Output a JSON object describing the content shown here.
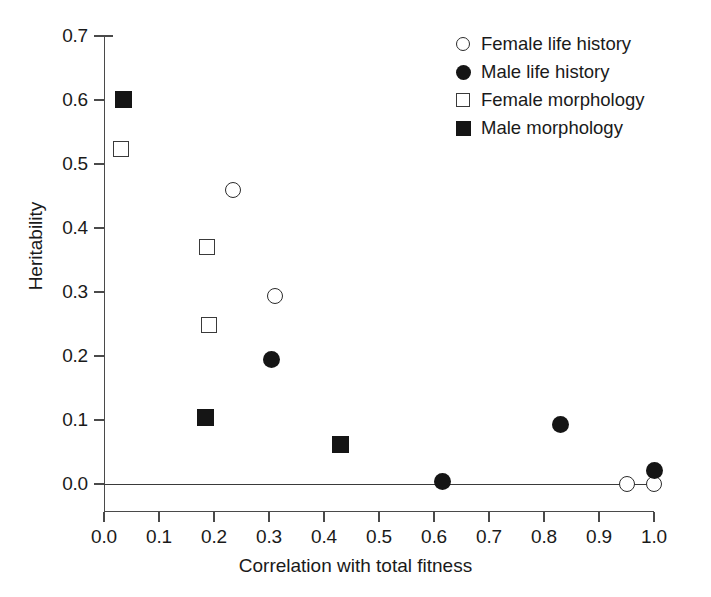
{
  "chart_data": {
    "type": "scatter",
    "title": "",
    "xlabel": "Correlation with total fitness",
    "ylabel": "Heritability",
    "xlim": [
      0.0,
      1.0
    ],
    "ylim": [
      0.0,
      0.7
    ],
    "xticks": [
      "0.0",
      "0.1",
      "0.2",
      "0.3",
      "0.4",
      "0.5",
      "0.6",
      "0.7",
      "0.8",
      "0.9",
      "1.0"
    ],
    "xtick_values": [
      0.0,
      0.1,
      0.2,
      0.3,
      0.4,
      0.5,
      0.6,
      0.7,
      0.8,
      0.9,
      1.0
    ],
    "yticks": [
      "0.0",
      "0.1",
      "0.2",
      "0.3",
      "0.4",
      "0.5",
      "0.6",
      "0.7"
    ],
    "ytick_values": [
      0.0,
      0.1,
      0.2,
      0.3,
      0.4,
      0.5,
      0.6,
      0.7
    ],
    "grid": false,
    "legend_position": "top-right",
    "zero_reference_line": 0.0,
    "series": [
      {
        "name": "Female life history",
        "marker": "circle-open",
        "points": [
          {
            "x": 0.235,
            "y": 0.46
          },
          {
            "x": 0.31,
            "y": 0.293
          },
          {
            "x": 0.95,
            "y": 0.0
          },
          {
            "x": 1.0,
            "y": 0.0
          }
        ]
      },
      {
        "name": "Male life history",
        "marker": "circle-filled",
        "points": [
          {
            "x": 0.305,
            "y": 0.194
          },
          {
            "x": 0.615,
            "y": 0.004
          },
          {
            "x": 0.83,
            "y": 0.093
          },
          {
            "x": 1.0,
            "y": 0.021
          }
        ]
      },
      {
        "name": "Female morphology",
        "marker": "square-open",
        "points": [
          {
            "x": 0.03,
            "y": 0.523
          },
          {
            "x": 0.188,
            "y": 0.37
          },
          {
            "x": 0.19,
            "y": 0.249
          }
        ]
      },
      {
        "name": "Male morphology",
        "marker": "square-filled",
        "points": [
          {
            "x": 0.035,
            "y": 0.601
          },
          {
            "x": 0.185,
            "y": 0.104
          },
          {
            "x": 0.43,
            "y": 0.061
          }
        ]
      }
    ]
  },
  "legend": {
    "entries": [
      {
        "label": "Female life history",
        "marker": "circle-open"
      },
      {
        "label": "Male life history",
        "marker": "circle-filled"
      },
      {
        "label": "Female morphology",
        "marker": "square-open"
      },
      {
        "label": "Male morphology",
        "marker": "square-filled"
      }
    ]
  },
  "colors": {
    "marker_fill": "#151515",
    "marker_stroke": "#2b2b2b",
    "axis": "#4a4a4a",
    "background": "#ffffff",
    "text": "#1a1a1a"
  }
}
